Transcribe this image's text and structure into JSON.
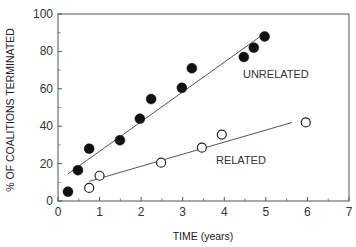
{
  "chart_data": {
    "type": "scatter",
    "title": "",
    "xlabel": "TIME (years)",
    "ylabel": "% OF COALITIONS TERMINATED",
    "xlim": [
      0,
      7
    ],
    "ylim": [
      0,
      100
    ],
    "xticks": [
      0,
      1,
      2,
      3,
      4,
      5,
      6,
      7
    ],
    "yticks": [
      0,
      20,
      40,
      60,
      80,
      100
    ],
    "grid": false,
    "legend": "none",
    "series": [
      {
        "name": "UNRELATED",
        "marker": "filled-circle",
        "x": [
          0.24,
          0.48,
          0.75,
          1.49,
          1.97,
          2.24,
          2.98,
          3.22,
          4.47,
          4.71,
          4.97
        ],
        "y": [
          5,
          16.5,
          28,
          32.5,
          44,
          54.5,
          60.5,
          71,
          77,
          82,
          88
        ],
        "fit_line": {
          "x": [
            0.24,
            4.93
          ],
          "y": [
            14.5,
            89
          ]
        }
      },
      {
        "name": "RELATED",
        "marker": "open-circle",
        "x": [
          0.75,
          1.0,
          2.48,
          3.46,
          3.94,
          5.96
        ],
        "y": [
          7,
          13.5,
          20.5,
          28.5,
          35.5,
          42
        ],
        "fit_line": {
          "x": [
            0.75,
            5.63
          ],
          "y": [
            10.5,
            42
          ]
        }
      }
    ],
    "annotations": [
      {
        "text": "UNRELATED",
        "x": 4.45,
        "y": 66
      },
      {
        "text": "RELATED",
        "x": 3.8,
        "y": 20
      }
    ]
  }
}
